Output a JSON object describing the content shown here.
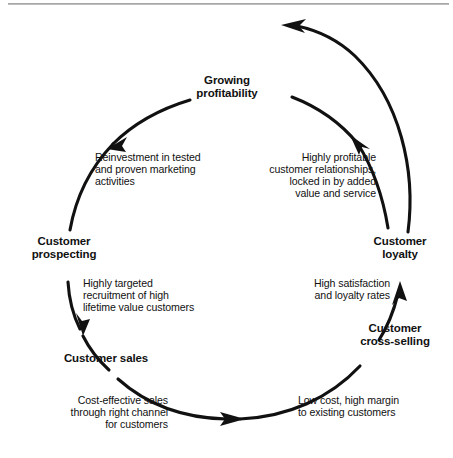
{
  "diagram": {
    "type": "virtuous-cycle-flow-diagram",
    "shape": "circle",
    "direction": "clockwise",
    "line_color": "#111111",
    "background_color": "#ffffff",
    "rule_color": "#9a9a9a",
    "nodes": [
      {
        "id": "growing-profitability",
        "label": "Growing\nprofitability",
        "align": "center",
        "position": "top"
      },
      {
        "id": "customer-loyalty",
        "label": "Customer\nloyalty",
        "align": "center",
        "position": "right"
      },
      {
        "id": "customer-cross-selling",
        "label": "Customer\ncross-selling",
        "align": "center",
        "position": "lower-right"
      },
      {
        "id": "customer-sales",
        "label": "Customer sales",
        "align": "center",
        "position": "lower-left"
      },
      {
        "id": "customer-prospecting",
        "label": "Customer\nprospecting",
        "align": "center",
        "position": "left"
      }
    ],
    "descriptions": [
      {
        "id": "reinvestment",
        "text": "Reinvestment in tested\nand proven marketing\nactivities",
        "align": "left",
        "position": "upper-left"
      },
      {
        "id": "highly-profitable",
        "text": "Highly profitable\ncustomer relationships,\nlocked in by added\nvalue and service",
        "align": "right",
        "position": "upper-right"
      },
      {
        "id": "highly-targeted",
        "text": "Highly targeted\nrecruitment of high\nlifetime value customers",
        "align": "left",
        "position": "mid-left"
      },
      {
        "id": "high-satisfaction",
        "text": "High satisfaction\nand loyalty rates",
        "align": "right",
        "position": "mid-right"
      },
      {
        "id": "cost-effective",
        "text": "Cost-effective sales\nthrough right channel\nfor customers",
        "align": "right",
        "position": "lower-left"
      },
      {
        "id": "low-cost",
        "text": "Low cost, high margin\nto existing customers",
        "align": "left",
        "position": "lower-right"
      }
    ],
    "arrows": [
      {
        "id": "arrow-to-reinvestment",
        "points_to": "upper-left",
        "direction": "down-left"
      },
      {
        "id": "arrow-to-prospecting",
        "points_to": "left-lower",
        "direction": "down"
      },
      {
        "id": "arrow-to-sales",
        "points_to": "bottom",
        "direction": "right"
      },
      {
        "id": "arrow-to-cross-selling",
        "points_to": "right-lower",
        "direction": "up"
      },
      {
        "id": "arrow-to-loyalty",
        "points_to": "upper-right",
        "direction": "up-left"
      },
      {
        "id": "arrow-return-to-growing",
        "points_to": "top-outer",
        "direction": "up-left"
      }
    ]
  }
}
